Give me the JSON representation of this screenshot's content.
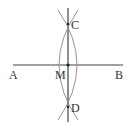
{
  "diagram": {
    "type": "geometric-construction",
    "colors": {
      "line": "#444444",
      "arc": "#888888",
      "point": "#222222",
      "text": "#333333"
    },
    "points": {
      "A": {
        "label": "A",
        "x": 13,
        "y": 65
      },
      "B": {
        "label": "B",
        "x": 123,
        "y": 65
      },
      "M": {
        "label": "M",
        "x": 68,
        "y": 65
      },
      "C": {
        "label": "C",
        "x": 68,
        "y": 24
      },
      "D": {
        "label": "D",
        "x": 68,
        "y": 107
      }
    },
    "segments": [
      {
        "from": "A",
        "to": "B",
        "name": "segment-AB"
      },
      {
        "from": "C",
        "to": "D",
        "name": "perpendicular-bisector-CD",
        "extended": true
      }
    ],
    "arcs": [
      {
        "name": "arc-left",
        "through": [
          "C",
          "D"
        ],
        "bulge": "left"
      },
      {
        "name": "arc-right",
        "through": [
          "C",
          "D"
        ],
        "bulge": "right"
      }
    ]
  }
}
